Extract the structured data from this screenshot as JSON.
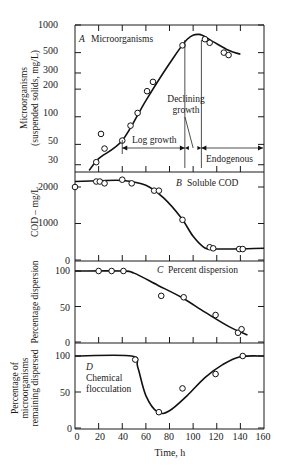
{
  "chart_data": [
    {
      "id": "A",
      "type": "scatter",
      "panel_label": "A",
      "title": "Microorganisms",
      "ylabel": "Microorganisms (suspended solids, mg/L)",
      "xlabel": "Time, h",
      "yscale": "log",
      "ylim": [
        25,
        1000
      ],
      "yticks": [
        30,
        50,
        100,
        200,
        300,
        500,
        1000
      ],
      "x": [
        18,
        22,
        25,
        40,
        47,
        53,
        61,
        66,
        91,
        110,
        114,
        126,
        130
      ],
      "values": [
        32,
        65,
        45,
        55,
        80,
        110,
        190,
        240,
        600,
        700,
        640,
        500,
        470
      ],
      "curve": {
        "x": [
          12,
          20,
          40,
          60,
          80,
          95,
          105,
          115,
          130,
          140
        ],
        "y": [
          26,
          35,
          55,
          150,
          380,
          700,
          790,
          680,
          530,
          480
        ]
      },
      "annotations": [
        {
          "text": "Log growth",
          "x_range": [
            40,
            93
          ]
        },
        {
          "text": "Declining growth",
          "x_range": [
            93,
            107
          ]
        },
        {
          "text": "Endogenous",
          "x_range": [
            107,
            160
          ]
        }
      ],
      "phase_lines_x": [
        93,
        107
      ]
    },
    {
      "id": "B",
      "type": "scatter",
      "panel_label": "B",
      "title": "Soluble COD",
      "ylabel": "COD – mg/L",
      "ylim": [
        0,
        2300
      ],
      "yticks": [
        0,
        1000,
        2000
      ],
      "x": [
        0,
        18,
        21,
        25,
        40,
        48,
        67,
        71,
        91,
        114,
        117,
        139,
        142
      ],
      "values": [
        2000,
        2150,
        2150,
        2100,
        2200,
        2100,
        1900,
        1900,
        1100,
        350,
        320,
        300,
        300
      ],
      "curve": {
        "x": [
          0,
          20,
          40,
          60,
          75,
          90,
          100,
          110,
          120,
          160
        ],
        "y": [
          2150,
          2170,
          2180,
          2050,
          1700,
          1150,
          650,
          330,
          300,
          320
        ]
      }
    },
    {
      "id": "C",
      "type": "scatter",
      "panel_label": "C",
      "title": "Percent dispersion",
      "ylabel": "Percentage dispersion",
      "ylim": [
        0,
        105
      ],
      "yticks": [
        0,
        50,
        100
      ],
      "x": [
        20,
        31,
        41,
        73,
        92,
        119,
        138,
        141
      ],
      "values": [
        100,
        100,
        100,
        65,
        63,
        38,
        13,
        18
      ],
      "curve": {
        "x": [
          0,
          40,
          50,
          70,
          90,
          110,
          130,
          146
        ],
        "y": [
          100,
          100,
          97,
          80,
          63,
          42,
          22,
          10
        ]
      }
    },
    {
      "id": "D",
      "type": "scatter",
      "panel_label": "D",
      "title": "Chemical flocculation",
      "ylabel": "Percentage of microorganisms remaining dispersed",
      "ylim": [
        0,
        105
      ],
      "yticks": [
        0,
        50,
        100
      ],
      "x": [
        51,
        71,
        91,
        119,
        142
      ],
      "values": [
        95,
        22,
        55,
        75,
        100
      ],
      "curve": {
        "x": [
          0,
          48,
          53,
          60,
          70,
          80,
          95,
          110,
          125,
          140,
          160
        ],
        "y": [
          100,
          100,
          85,
          45,
          22,
          24,
          45,
          70,
          88,
          99,
          100
        ]
      }
    }
  ],
  "xaxis": {
    "label": "Time, h",
    "ticks": [
      0,
      20,
      40,
      60,
      80,
      100,
      120,
      140,
      160
    ],
    "range": [
      0,
      160
    ]
  },
  "labels": {
    "a_letter": "A",
    "a_title": "Microorganisms",
    "b_letter": "B",
    "b_title": "Soluble COD",
    "c_letter": "C",
    "c_title": "Percent dispersion",
    "d_letter": "D",
    "d_title_1": "Chemical",
    "d_title_2": "flocculation",
    "log_growth": "Log growth",
    "declining_1": "Declining",
    "declining_2": "growth",
    "endogenous": "Endogenous",
    "ylabel_a_1": "Microorganisms",
    "ylabel_a_2": "(suspended solids, mg/L)",
    "ylabel_b": "COD – mg/L",
    "ylabel_c": "Percentage dispersion",
    "ylabel_d_1": "Percentage of",
    "ylabel_d_2": "microorganisms",
    "ylabel_d_3": "remaining dispersed",
    "xlabel": "Time, h"
  },
  "ticks_text": {
    "a": [
      "1000",
      "500",
      "300",
      "200",
      "100",
      "50",
      "30"
    ],
    "b": [
      "2000",
      "1000",
      "0"
    ],
    "c": [
      "100",
      "50",
      "0"
    ],
    "d": [
      "100",
      "50",
      "0"
    ],
    "x": [
      "0",
      "20",
      "40",
      "60",
      "80",
      "100",
      "120",
      "140",
      "160"
    ]
  }
}
